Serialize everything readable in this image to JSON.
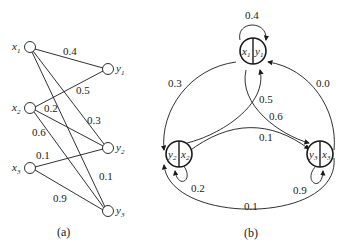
{
  "diagram_a": {
    "caption": "(a)",
    "inputs": [
      {
        "id": "x1",
        "label": "x",
        "sub": "1"
      },
      {
        "id": "x2",
        "label": "x",
        "sub": "2"
      },
      {
        "id": "x3",
        "label": "x",
        "sub": "3"
      }
    ],
    "outputs": [
      {
        "id": "y1",
        "label": "y",
        "sub": "1"
      },
      {
        "id": "y2",
        "label": "y",
        "sub": "2"
      },
      {
        "id": "y3",
        "label": "y",
        "sub": "3"
      }
    ],
    "edges": [
      {
        "from": "x1",
        "to": "y1",
        "weight": "0.4"
      },
      {
        "from": "x2",
        "to": "y1",
        "weight": "0.5"
      },
      {
        "from": "x2",
        "to": "y2",
        "weight": "0.2"
      },
      {
        "from": "x1",
        "to": "y2",
        "weight": "0.3"
      },
      {
        "from": "x2",
        "to": "y3",
        "weight": "0.6"
      },
      {
        "from": "x3",
        "to": "y2",
        "weight": "0.1"
      },
      {
        "from": "x1",
        "to": "y3",
        "weight": "0.1"
      },
      {
        "from": "x3",
        "to": "y3",
        "weight": "0.9"
      }
    ]
  },
  "diagram_b": {
    "caption": "(b)",
    "nodes": [
      {
        "id": "n1",
        "left": "x",
        "left_sub": "1",
        "right": "y",
        "right_sub": "1"
      },
      {
        "id": "n2",
        "left": "y",
        "left_sub": "2",
        "right": "x",
        "right_sub": "2"
      },
      {
        "id": "n3",
        "left": "y",
        "left_sub": "3",
        "right": "x",
        "right_sub": "3"
      }
    ],
    "edges": [
      {
        "from": "n1",
        "to": "n1",
        "weight": "0.4"
      },
      {
        "from": "n1",
        "to": "n2",
        "weight": "0.3"
      },
      {
        "from": "n3",
        "to": "n1",
        "weight": "0.0"
      },
      {
        "from": "n2",
        "to": "n1",
        "weight": "0.5"
      },
      {
        "from": "n1",
        "to": "n3",
        "weight": "0.6"
      },
      {
        "from": "n2",
        "to": "n3",
        "weight": "0.1"
      },
      {
        "from": "n2",
        "to": "n2",
        "weight": "0.2"
      },
      {
        "from": "n3",
        "to": "n3",
        "weight": "0.9"
      },
      {
        "from": "n3",
        "to": "n2",
        "weight": "0.1"
      }
    ]
  }
}
